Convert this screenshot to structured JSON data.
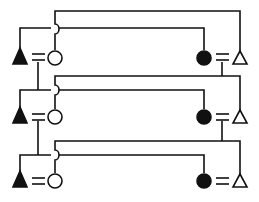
{
  "diagram": {
    "type": "pedigree",
    "stroke_color": "#111111",
    "background": "#ffffff",
    "generations": [
      {
        "index": 1,
        "left_couple": {
          "male": "filled-triangle",
          "female": "open-circle"
        },
        "right_couple": {
          "female": "filled-circle",
          "male": "open-triangle"
        }
      },
      {
        "index": 2,
        "left_couple": {
          "male": "filled-triangle",
          "female": "open-circle"
        },
        "right_couple": {
          "female": "filled-circle",
          "male": "open-triangle"
        }
      },
      {
        "index": 3,
        "left_couple": {
          "male": "filled-triangle",
          "female": "open-circle"
        },
        "right_couple": {
          "female": "filled-circle",
          "male": "open-triangle"
        }
      }
    ]
  }
}
